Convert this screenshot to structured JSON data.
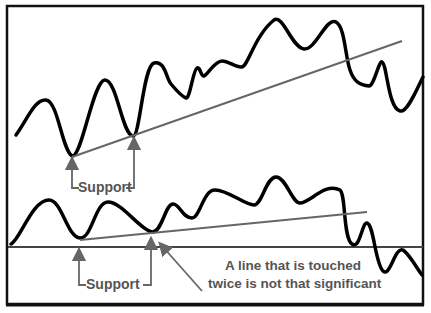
{
  "diagram": {
    "colors": {
      "frame": "#111111",
      "price": "#000000",
      "trendline": "#666666",
      "arrow": "#666666",
      "text": "#555555",
      "background": "#ffffff"
    },
    "top_panel": {
      "support_label": "Support",
      "touches": 2
    },
    "bottom_panel": {
      "support_label": "Support",
      "touches": 2,
      "note_line1": "A line that is touched",
      "note_line2": "twice is not that significant"
    }
  }
}
